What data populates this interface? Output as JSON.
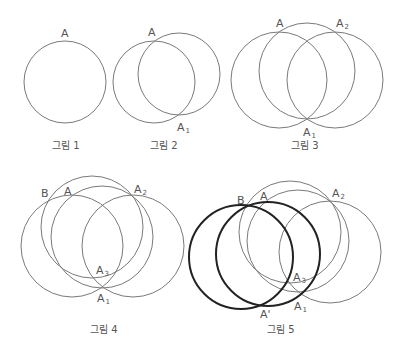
{
  "figures": [
    {
      "caption": "그림 1",
      "caption_pos": [
        52,
        149
      ],
      "circles": [
        {
          "cx": 65,
          "cy": 82,
          "r": 41,
          "thick": false
        }
      ],
      "labels": [
        {
          "text": "A",
          "sub": "",
          "x": 61,
          "y": 37
        }
      ]
    },
    {
      "caption": "그림 2",
      "caption_pos": [
        150,
        149
      ],
      "circles": [
        {
          "cx": 154,
          "cy": 82,
          "r": 41,
          "thick": false
        },
        {
          "cx": 179,
          "cy": 74,
          "r": 41,
          "thick": false
        }
      ],
      "labels": [
        {
          "text": "A",
          "sub": "",
          "x": 148,
          "y": 36
        },
        {
          "text": "A",
          "sub": "1",
          "x": 177,
          "y": 131
        }
      ]
    },
    {
      "caption": "그림 3",
      "caption_pos": [
        291,
        149
      ],
      "circles": [
        {
          "cx": 279,
          "cy": 80,
          "r": 48,
          "thick": false
        },
        {
          "cx": 307,
          "cy": 71,
          "r": 48,
          "thick": false
        },
        {
          "cx": 335,
          "cy": 80,
          "r": 48,
          "thick": false
        }
      ],
      "labels": [
        {
          "text": "A",
          "sub": "",
          "x": 276,
          "y": 27
        },
        {
          "text": "A",
          "sub": "2",
          "x": 336,
          "y": 27
        },
        {
          "text": "A",
          "sub": "1",
          "x": 303,
          "y": 136
        }
      ]
    },
    {
      "caption": "그림 4",
      "caption_pos": [
        90,
        333
      ],
      "circles": [
        {
          "cx": 72,
          "cy": 246,
          "r": 51,
          "thick": false
        },
        {
          "cx": 102,
          "cy": 237,
          "r": 51,
          "thick": false
        },
        {
          "cx": 133,
          "cy": 246,
          "r": 51,
          "thick": false
        },
        {
          "cx": 92,
          "cy": 227,
          "r": 51,
          "thick": false
        }
      ],
      "labels": [
        {
          "text": "B",
          "sub": "",
          "x": 41,
          "y": 197
        },
        {
          "text": "A",
          "sub": "",
          "x": 64,
          "y": 195
        },
        {
          "text": "A",
          "sub": "2",
          "x": 134,
          "y": 193
        },
        {
          "text": "A",
          "sub": "3",
          "x": 96,
          "y": 274
        },
        {
          "text": "A",
          "sub": "1",
          "x": 97,
          "y": 302
        }
      ]
    },
    {
      "caption": "그림 5",
      "caption_pos": [
        267,
        333
      ],
      "circles": [
        {
          "cx": 290,
          "cy": 232,
          "r": 51,
          "thick": false
        },
        {
          "cx": 298,
          "cy": 241,
          "r": 51,
          "thick": false
        },
        {
          "cx": 330,
          "cy": 252,
          "r": 51,
          "thick": false
        },
        {
          "cx": 241,
          "cy": 257,
          "r": 52,
          "thick": true
        },
        {
          "cx": 268,
          "cy": 254,
          "r": 52,
          "thick": true
        }
      ],
      "labels": [
        {
          "text": "B",
          "sub": "",
          "x": 237,
          "y": 204
        },
        {
          "text": "A",
          "sub": "",
          "x": 260,
          "y": 200
        },
        {
          "text": "A",
          "sub": "2",
          "x": 332,
          "y": 197
        },
        {
          "text": "A",
          "sub": "3",
          "x": 293,
          "y": 281
        },
        {
          "text": "A",
          "sub": "1",
          "x": 294,
          "y": 310
        },
        {
          "text": "A'",
          "sub": "",
          "x": 260,
          "y": 318
        }
      ]
    }
  ]
}
